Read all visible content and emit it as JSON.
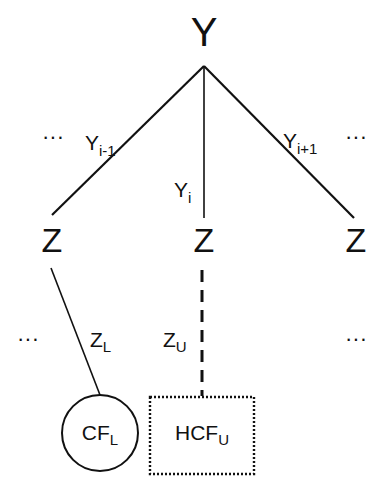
{
  "root": {
    "label": "Y"
  },
  "branches": [
    {
      "label": "Y",
      "sub": "i-1"
    },
    {
      "label": "Y",
      "sub": "i"
    },
    {
      "label": "Y",
      "sub": "i+1"
    }
  ],
  "ellipsis": "···",
  "children": [
    {
      "label": "Z"
    },
    {
      "label": "Z"
    },
    {
      "label": "Z"
    }
  ],
  "lower_edges": [
    {
      "label": "Z",
      "sub": "L",
      "style": "solid"
    },
    {
      "label": "Z",
      "sub": "U",
      "style": "dashed"
    }
  ],
  "leaves": [
    {
      "label": "CF",
      "sub": "L",
      "shape": "circle"
    },
    {
      "label": "HCF",
      "sub": "U",
      "shape": "dotted-rectangle"
    }
  ]
}
